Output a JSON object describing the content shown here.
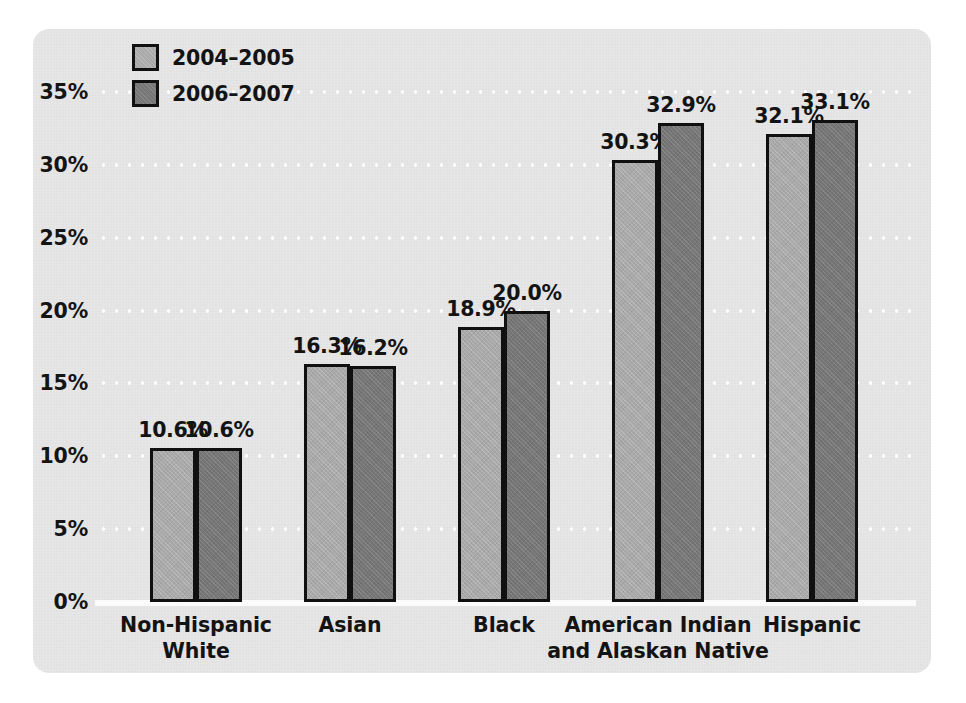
{
  "chart_data": {
    "type": "bar",
    "title": "",
    "subtitle": "",
    "xlabel": "",
    "ylabel": "",
    "ylim": [
      0,
      35
    ],
    "y_tick_labels": [
      "0%",
      "5%",
      "10%",
      "15%",
      "20%",
      "25%",
      "30%",
      "35%"
    ],
    "y_tick_values": [
      0,
      5,
      10,
      15,
      20,
      25,
      30,
      35
    ],
    "grid": true,
    "grid_style": "dotted-white-horizontal",
    "legend_position": "top-left",
    "value_label_suffix": "%",
    "categories": [
      "Non-Hispanic\nWhite",
      "Asian",
      "Black",
      "American Indian\nand Alaskan Native",
      "Hispanic"
    ],
    "category_lines": [
      [
        "Non-Hispanic",
        "White"
      ],
      [
        "Asian"
      ],
      [
        "Black"
      ],
      [
        "American Indian",
        "and Alaskan Native"
      ],
      [
        "Hispanic"
      ]
    ],
    "series": [
      {
        "name": "2004–2005",
        "color": "#a9a9a9",
        "values": [
          10.6,
          16.3,
          18.9,
          30.3,
          32.1
        ],
        "labels": [
          "10.6%",
          "16.3%",
          "18.9%",
          "30.3%",
          "32.1%"
        ]
      },
      {
        "name": "2006–2007",
        "color": "#767676",
        "values": [
          10.6,
          16.2,
          20.0,
          32.9,
          33.1
        ],
        "labels": [
          "10.6%",
          "16.2%",
          "20.0%",
          "32.9%",
          "33.1%"
        ]
      }
    ]
  },
  "colors": {
    "panel_background": "#e4e4e4",
    "page_background": "#ffffff",
    "bar_outline": "#101010",
    "text": "#131313",
    "gridline": "#ffffff",
    "baseline": "#fbfbfb",
    "series_2004_2005": "#a9a9a9",
    "series_2006_2007": "#767676"
  },
  "legend": {
    "items": [
      {
        "label": "2004–2005",
        "swatch": "light-gray-swatch"
      },
      {
        "label": "2006–2007",
        "swatch": "dark-gray-swatch"
      }
    ]
  },
  "y_axis": {
    "ticks": [
      {
        "label": "35%",
        "value": 35
      },
      {
        "label": "30%",
        "value": 30
      },
      {
        "label": "25%",
        "value": 25
      },
      {
        "label": "20%",
        "value": 20
      },
      {
        "label": "15%",
        "value": 15
      },
      {
        "label": "10%",
        "value": 10
      },
      {
        "label": "5%",
        "value": 5
      },
      {
        "label": "0%",
        "value": 0
      }
    ]
  }
}
